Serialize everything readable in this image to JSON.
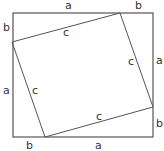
{
  "diagram": {
    "title": "",
    "colors": {
      "outer_stroke": "#555555",
      "inner_stroke": "#555555",
      "label": "#333333",
      "background": "#ffffff"
    },
    "outer_square": {
      "x1": 13,
      "y1": 13,
      "x2": 153,
      "y2": 137
    },
    "inner_square": {
      "points": [
        [
          120,
          13
        ],
        [
          153,
          107
        ],
        [
          45,
          137
        ],
        [
          12,
          42
        ]
      ]
    },
    "labels": [
      {
        "id": "top-a",
        "text": "a",
        "x": 65,
        "y": 9
      },
      {
        "id": "top-b",
        "text": "b",
        "x": 135,
        "y": 9
      },
      {
        "id": "left-b",
        "text": "b",
        "x": 3,
        "y": 31
      },
      {
        "id": "left-a",
        "text": "a",
        "x": 3,
        "y": 94
      },
      {
        "id": "right-a",
        "text": "a",
        "x": 156,
        "y": 64
      },
      {
        "id": "right-b",
        "text": "b",
        "x": 156,
        "y": 127
      },
      {
        "id": "bottom-b",
        "text": "b",
        "x": 26,
        "y": 149
      },
      {
        "id": "bottom-a",
        "text": "a",
        "x": 95,
        "y": 149
      },
      {
        "id": "inner-top-c",
        "text": "c",
        "x": 63,
        "y": 36
      },
      {
        "id": "inner-right-c",
        "text": "c",
        "x": 128,
        "y": 65
      },
      {
        "id": "inner-left-c",
        "text": "c",
        "x": 32,
        "y": 94
      },
      {
        "id": "inner-bottom-c",
        "text": "c",
        "x": 96,
        "y": 120
      }
    ]
  }
}
